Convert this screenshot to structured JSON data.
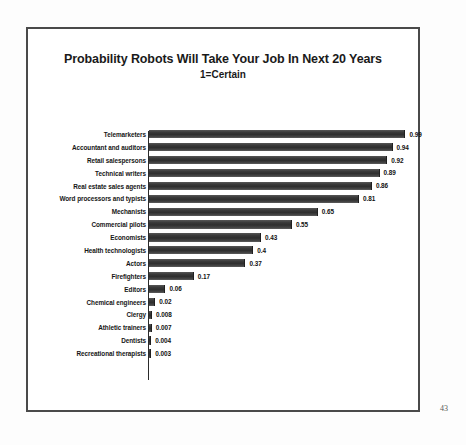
{
  "slide": {
    "page_number": "43"
  },
  "chart_data": {
    "type": "bar",
    "orientation": "horizontal",
    "title": "Probability Robots Will Take Your Job In Next 20 Years",
    "subtitle": "1=Certain",
    "xlabel": "",
    "ylabel": "",
    "xlim": [
      0,
      1
    ],
    "grid": false,
    "legend": null,
    "categories": [
      "Telemarketers",
      "Accountant and auditors",
      "Retail salespersons",
      "Technical writers",
      "Real estate sales agents",
      "Word processors and typists",
      "Mechanists",
      "Commercial pilots",
      "Economists",
      "Health technologists",
      "Actors",
      "Firefighters",
      "Editors",
      "Chemical engineers",
      "Clergy",
      "Athletic trainers",
      "Dentists",
      "Recreational therapists"
    ],
    "values": [
      0.99,
      0.94,
      0.92,
      0.89,
      0.86,
      0.81,
      0.65,
      0.55,
      0.43,
      0.4,
      0.37,
      0.17,
      0.06,
      0.02,
      0.008,
      0.007,
      0.004,
      0.003
    ],
    "value_labels": [
      "0.99",
      "0.94",
      "0.92",
      "0.89",
      "0.86",
      "0.81",
      "0.65",
      "0.55",
      "0.43",
      "0.4",
      "0.37",
      "0.17",
      "0.06",
      "0.02",
      "0.008",
      "0.007",
      "0.004",
      "0.003"
    ],
    "bar_color": "#3d3d3d",
    "frame_color": "#4a4a4a",
    "background": "#ffffff"
  }
}
